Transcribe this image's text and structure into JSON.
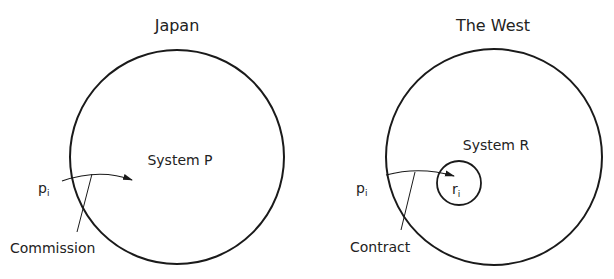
{
  "panels": [
    {
      "title": "Japan",
      "system_label": "System P",
      "input_label": "p",
      "input_subscript": "i",
      "boundary_label": "Commission"
    },
    {
      "title": "The West",
      "system_label": "System R",
      "input_label": "p",
      "input_subscript": "i",
      "inner_label": "r",
      "inner_subscript": "i",
      "boundary_label": "Contract"
    }
  ],
  "colors": {
    "stroke": "#1a1a1a",
    "background": "#ffffff"
  }
}
